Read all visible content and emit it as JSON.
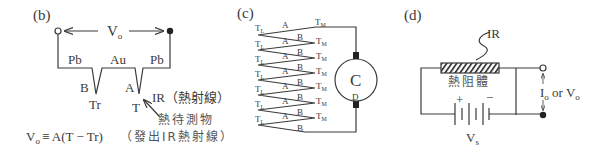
{
  "panels": {
    "b": {
      "label": "(b)",
      "vo_label": "V",
      "vo_sub": "o",
      "wires": [
        "Pb",
        "Au",
        "Pb"
      ],
      "junction_ref": {
        "letter": "B",
        "temp": "Tr"
      },
      "junction_hot": {
        "letter": "A",
        "temp": "T"
      },
      "ir_label": "IR（熱射線）",
      "target_label": "熱待測物",
      "target_note": "（發出IR熱射線）",
      "equation": {
        "lhs": "V",
        "lhs_sub": "o",
        "rhs": "≡ A(T − Tr)"
      }
    },
    "c": {
      "label": "(c)",
      "cold_label": "T",
      "cold_sub": "L",
      "hot_label": "T",
      "hot_sub": "M",
      "leg_a": "A",
      "leg_b": "B",
      "meter_label": "C",
      "meter_sub_label": "D",
      "pairs": 7
    },
    "d": {
      "label": "(d)",
      "ir_label": "IR",
      "resistor_label": "熱阻體",
      "plus": "+",
      "minus": "−",
      "source_label": "V",
      "source_sub": "s",
      "output_label": {
        "i": "I",
        "i_sub": "o",
        "or": " or ",
        "v": "V",
        "v_sub": "o"
      }
    }
  }
}
